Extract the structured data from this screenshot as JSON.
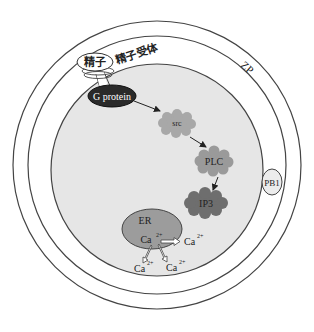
{
  "diagram": {
    "title": "",
    "labels": {
      "sperm": "精子",
      "sperm_receptor": "精子受体",
      "zona_pellucida": "ZP",
      "g_protein": "G protein",
      "src": "src",
      "plc": "PLC",
      "ip3": "IP3",
      "er": "ER",
      "polar_body": "PB1",
      "calcium_base": "Ca",
      "calcium_charge": "2+"
    },
    "colors": {
      "cytoplasm": "#e6e6e6",
      "outline": "#444444",
      "g_protein": "#2a2a2a",
      "src": "#a8a8a8",
      "plc": "#9a9a9a",
      "ip3": "#6e6e6e",
      "er": "#9c9c9c",
      "polar_body": "#ececec"
    },
    "pathway": [
      "精子",
      "精子受体",
      "G protein",
      "src",
      "PLC",
      "IP3",
      "ER",
      "Ca2+"
    ]
  }
}
